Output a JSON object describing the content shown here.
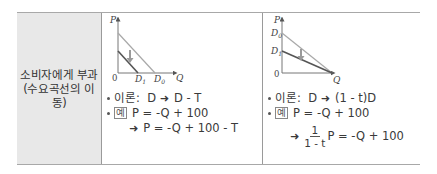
{
  "row": {
    "label_line1": "소비자에게 부과",
    "label_line2": "(수요곡선의 이동)"
  },
  "left_case": {
    "diagram": {
      "y_axis": "P",
      "x_axis": "Q",
      "origin": "0",
      "curve_original": "D",
      "curve_original_sub": "0",
      "curve_new": "D",
      "curve_new_sub": "1",
      "shift": "parallel downward shift"
    },
    "theory_label": "이론:",
    "theory_from": "D",
    "theory_to": "D - T",
    "example_badge": "예",
    "example_eq": "P = -Q + 100",
    "result_eq": "P = -Q + 100 - T"
  },
  "right_case": {
    "diagram": {
      "y_axis": "P",
      "x_axis": "Q",
      "origin": "0",
      "curve_original": "D",
      "curve_original_sub": "0",
      "curve_new": "D",
      "curve_new_sub": "1",
      "shift": "rotation about Q-intercept"
    },
    "theory_label": "이론:",
    "theory_from": "D",
    "theory_to": "(1 - t)D",
    "example_badge": "예",
    "example_eq": "P = -Q + 100",
    "result_frac_num": "1",
    "result_frac_den": "1 - t",
    "result_rest": "P = -Q + 100"
  },
  "symbols": {
    "arrow": "➜"
  }
}
